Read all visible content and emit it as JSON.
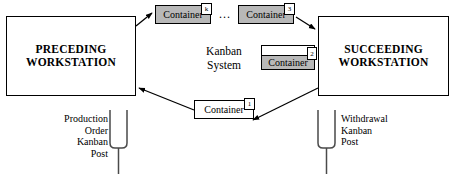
{
  "diagram": {
    "center_label": "Kanban\nSystem",
    "ellipsis": "...",
    "colors": {
      "container_filled": "#b8b8b8",
      "container_empty": "#ffffff",
      "line": "#000000",
      "background": "#ffffff"
    },
    "workstations": [
      {
        "id": "preceding",
        "label": "PRECEDING\nWORKSTATION"
      },
      {
        "id": "succeeding",
        "label": "SUCCEEDING\nWORKSTATION"
      }
    ],
    "containers": [
      {
        "id": "k",
        "label": "Container",
        "tag": "k",
        "state": "full"
      },
      {
        "id": "3",
        "label": "Container",
        "tag": "3",
        "state": "full"
      },
      {
        "id": "2",
        "label": "Container",
        "tag": "2",
        "state": "partial"
      },
      {
        "id": "1",
        "label": "Container",
        "tag": "1",
        "state": "empty"
      }
    ],
    "posts": [
      {
        "id": "production-order-kanban-post",
        "label": "Production\nOrder\nKanban\nPost"
      },
      {
        "id": "withdrawal-kanban-post",
        "label": "Withdrawal\nKanban\nPost"
      }
    ]
  }
}
